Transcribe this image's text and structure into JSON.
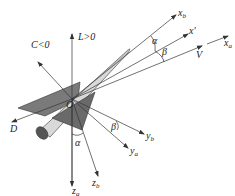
{
  "diagram": {
    "origin_label": "O",
    "axes": [
      {
        "id": "lift",
        "label": "L>0"
      },
      {
        "id": "side_force",
        "label": "C<0"
      },
      {
        "id": "drag",
        "label": "D"
      },
      {
        "id": "x_b",
        "label": "x",
        "sub": "b"
      },
      {
        "id": "x_prime",
        "label": "x'"
      },
      {
        "id": "velocity",
        "label": "V"
      },
      {
        "id": "x_a",
        "label": "x",
        "sub": "a"
      },
      {
        "id": "y_b",
        "label": "y",
        "sub": "b"
      },
      {
        "id": "y_a",
        "label": "y",
        "sub": "a"
      },
      {
        "id": "z_a",
        "label": "z",
        "sub": "a"
      },
      {
        "id": "z_b",
        "label": "z",
        "sub": "b"
      }
    ],
    "angles": [
      {
        "id": "alpha_top",
        "label": "α"
      },
      {
        "id": "beta_top",
        "label": "β"
      },
      {
        "id": "beta_bottom",
        "label": "β"
      },
      {
        "id": "alpha_bottom",
        "label": "α"
      }
    ],
    "colors": {
      "line": "#333333",
      "wing_dark": "#6e6e6e",
      "wing_mid": "#8c8c8c",
      "fuselage": "#d6d6d6"
    }
  }
}
